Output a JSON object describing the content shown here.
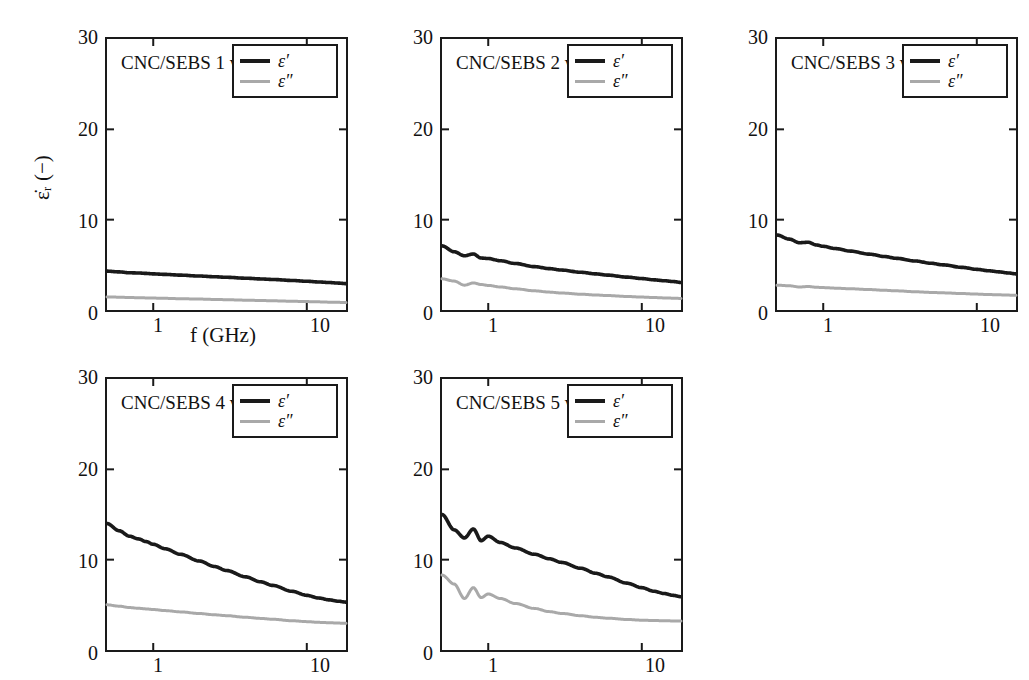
{
  "figure": {
    "axis_labels": {
      "x": "f (GHz)",
      "y": "ε̇ᵣ (−)"
    },
    "y_ticks": [
      "0",
      "10",
      "20",
      "30"
    ],
    "y_tick_values": [
      0,
      10,
      20,
      30
    ],
    "x_ticks": [
      "1",
      "10"
    ],
    "x_tick_values": [
      1,
      10
    ],
    "colors": {
      "eprime": "#1a1a1a",
      "edprime": "#a9a9a9",
      "axis": "#1a1a1a",
      "background": "#ffffff"
    },
    "legend": {
      "entries": [
        {
          "name": "eprime-series",
          "label": "ε′",
          "color": "#1a1a1a"
        },
        {
          "name": "edprime-series",
          "label": "ε″",
          "color": "#a9a9a9"
        }
      ]
    }
  },
  "chart_data": [
    {
      "type": "line",
      "title": "CNC/SEBS 1 wt%",
      "xlabel": "f (GHz)",
      "ylabel": "ε̇ᵣ (−)",
      "xscale": "log",
      "xlim": [
        0.5,
        18
      ],
      "ylim": [
        0,
        30
      ],
      "grid": false,
      "legend_position": "top-right",
      "x": [
        0.5,
        0.6,
        0.7,
        0.8,
        0.9,
        1.0,
        1.2,
        1.5,
        2.0,
        2.5,
        3.0,
        4.0,
        5.0,
        6.0,
        8.0,
        10.0,
        12.0,
        14.0,
        16.0,
        18.0
      ],
      "series": [
        {
          "name": "ε′",
          "color": "#1a1a1a",
          "values": [
            4.3,
            4.22,
            4.12,
            4.1,
            4.05,
            4.0,
            3.94,
            3.86,
            3.76,
            3.68,
            3.62,
            3.52,
            3.44,
            3.38,
            3.27,
            3.18,
            3.1,
            3.04,
            2.98,
            2.92
          ]
        },
        {
          "name": "ε″",
          "color": "#a9a9a9",
          "values": [
            1.45,
            1.42,
            1.38,
            1.36,
            1.34,
            1.32,
            1.29,
            1.25,
            1.21,
            1.17,
            1.14,
            1.09,
            1.05,
            1.02,
            0.97,
            0.93,
            0.9,
            0.87,
            0.85,
            0.82
          ]
        }
      ]
    },
    {
      "type": "line",
      "title": "CNC/SEBS 2 wt%",
      "xlabel": "f (GHz)",
      "ylabel": "ε̇ᵣ (−)",
      "xscale": "log",
      "xlim": [
        0.5,
        18
      ],
      "ylim": [
        0,
        30
      ],
      "grid": false,
      "legend_position": "top-right",
      "x": [
        0.5,
        0.6,
        0.7,
        0.8,
        0.9,
        1.0,
        1.2,
        1.5,
        2.0,
        2.5,
        3.0,
        4.0,
        5.0,
        6.0,
        8.0,
        10.0,
        12.0,
        14.0,
        16.0,
        18.0
      ],
      "series": [
        {
          "name": "ε′",
          "color": "#1a1a1a",
          "values": [
            7.1,
            6.45,
            6.0,
            6.2,
            5.75,
            5.7,
            5.45,
            5.15,
            4.8,
            4.58,
            4.42,
            4.18,
            4.0,
            3.86,
            3.64,
            3.48,
            3.34,
            3.24,
            3.15,
            3.05
          ]
        },
        {
          "name": "ε″",
          "color": "#a9a9a9",
          "values": [
            3.45,
            3.2,
            2.75,
            3.0,
            2.82,
            2.72,
            2.55,
            2.35,
            2.12,
            1.98,
            1.88,
            1.75,
            1.66,
            1.6,
            1.5,
            1.43,
            1.38,
            1.34,
            1.31,
            1.28
          ]
        }
      ]
    },
    {
      "type": "line",
      "title": "CNC/SEBS 3 wt%",
      "xlabel": "f (GHz)",
      "ylabel": "ε̇ᵣ (−)",
      "xscale": "log",
      "xlim": [
        0.5,
        18
      ],
      "ylim": [
        0,
        30
      ],
      "grid": false,
      "legend_position": "top-right",
      "x": [
        0.5,
        0.6,
        0.7,
        0.8,
        0.9,
        1.0,
        1.2,
        1.5,
        2.0,
        2.5,
        3.0,
        4.0,
        5.0,
        6.0,
        8.0,
        10.0,
        12.0,
        14.0,
        16.0,
        18.0
      ],
      "series": [
        {
          "name": "ε′",
          "color": "#1a1a1a",
          "values": [
            8.3,
            7.85,
            7.45,
            7.5,
            7.2,
            7.05,
            6.8,
            6.52,
            6.18,
            5.92,
            5.72,
            5.42,
            5.18,
            5.0,
            4.72,
            4.5,
            4.34,
            4.22,
            4.1,
            4.0
          ]
        },
        {
          "name": "ε″",
          "color": "#a9a9a9",
          "values": [
            2.75,
            2.68,
            2.55,
            2.6,
            2.52,
            2.48,
            2.42,
            2.35,
            2.26,
            2.18,
            2.12,
            2.02,
            1.95,
            1.9,
            1.82,
            1.76,
            1.71,
            1.68,
            1.65,
            1.62
          ]
        }
      ]
    },
    {
      "type": "line",
      "title": "CNC/SEBS 4 wt%",
      "xlabel": "f (GHz)",
      "ylabel": "ε̇ᵣ (−)",
      "xscale": "log",
      "xlim": [
        0.5,
        18
      ],
      "ylim": [
        0,
        30
      ],
      "grid": false,
      "legend_position": "top-right",
      "x": [
        0.5,
        0.6,
        0.7,
        0.8,
        0.9,
        1.0,
        1.2,
        1.5,
        2.0,
        2.5,
        3.0,
        4.0,
        5.0,
        6.0,
        8.0,
        10.0,
        12.0,
        14.0,
        16.0,
        18.0
      ],
      "series": [
        {
          "name": "ε′",
          "color": "#1a1a1a",
          "values": [
            14.0,
            13.2,
            12.6,
            12.3,
            12.0,
            11.7,
            11.2,
            10.6,
            9.85,
            9.25,
            8.8,
            8.1,
            7.55,
            7.15,
            6.5,
            6.05,
            5.75,
            5.55,
            5.4,
            5.3
          ]
        },
        {
          "name": "ε″",
          "color": "#a9a9a9",
          "values": [
            5.0,
            4.85,
            4.7,
            4.62,
            4.55,
            4.48,
            4.36,
            4.22,
            4.04,
            3.9,
            3.8,
            3.62,
            3.5,
            3.4,
            3.24,
            3.14,
            3.06,
            3.02,
            2.98,
            2.95
          ]
        }
      ]
    },
    {
      "type": "line",
      "title": "CNC/SEBS 5 wt%",
      "xlabel": "f (GHz)",
      "ylabel": "ε̇ᵣ (−)",
      "xscale": "log",
      "xlim": [
        0.5,
        18
      ],
      "ylim": [
        0,
        30
      ],
      "grid": false,
      "legend_position": "top-right",
      "x": [
        0.5,
        0.6,
        0.7,
        0.8,
        0.9,
        1.0,
        1.2,
        1.5,
        2.0,
        2.5,
        3.0,
        4.0,
        5.0,
        6.0,
        8.0,
        10.0,
        12.0,
        14.0,
        16.0,
        18.0
      ],
      "series": [
        {
          "name": "ε′",
          "color": "#1a1a1a",
          "values": [
            15.0,
            13.3,
            12.4,
            13.4,
            12.1,
            12.6,
            11.9,
            11.3,
            10.6,
            10.1,
            9.7,
            9.05,
            8.5,
            8.1,
            7.4,
            6.9,
            6.5,
            6.25,
            6.05,
            5.9
          ]
        },
        {
          "name": "ε″",
          "color": "#a9a9a9",
          "values": [
            8.3,
            7.3,
            5.7,
            6.9,
            5.8,
            6.2,
            5.7,
            5.15,
            4.6,
            4.25,
            4.05,
            3.8,
            3.62,
            3.52,
            3.38,
            3.3,
            3.26,
            3.24,
            3.22,
            3.22
          ]
        }
      ]
    }
  ]
}
